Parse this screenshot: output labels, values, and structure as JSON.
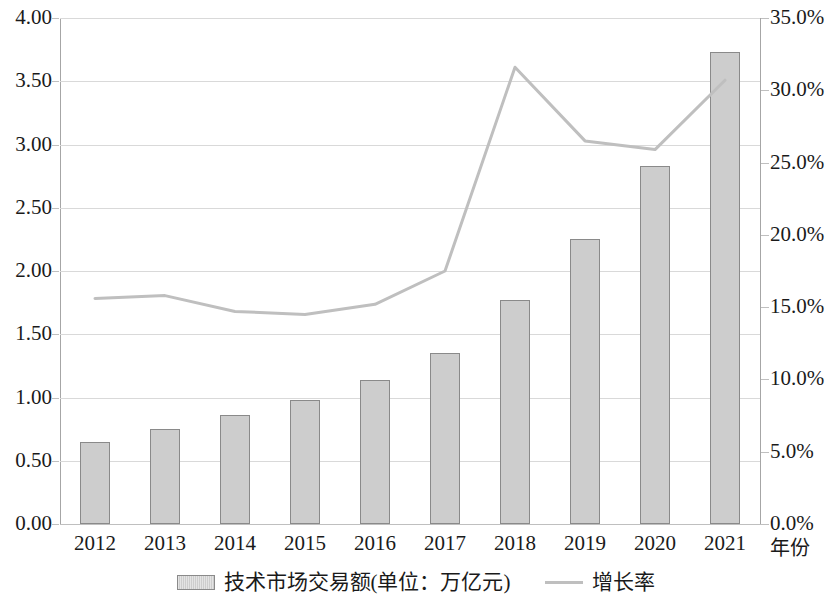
{
  "chart_data": {
    "type": "bar",
    "title": "",
    "subtitle": "",
    "categories": [
      "2012",
      "2013",
      "2014",
      "2015",
      "2016",
      "2017",
      "2018",
      "2019",
      "2020",
      "2021"
    ],
    "xlabel": "年份",
    "grid": true,
    "legend_position": "bottom",
    "series": [
      {
        "name": "技术市场交易额(单位：万亿元)",
        "type": "bar",
        "axis": "left",
        "color": "#cdcdcd",
        "border_color": "#8a8a8a",
        "values": [
          0.65,
          0.75,
          0.86,
          0.98,
          1.14,
          1.35,
          1.77,
          2.25,
          2.83,
          3.73
        ]
      },
      {
        "name": "增长率",
        "type": "line",
        "axis": "right",
        "color": "#bfbfbf",
        "values": [
          15.6,
          15.8,
          14.7,
          14.5,
          15.2,
          17.5,
          31.6,
          26.5,
          25.9,
          30.7
        ]
      }
    ],
    "left_axis": {
      "label": "",
      "ylim": [
        0.0,
        4.0
      ],
      "ticks": [
        "0.00",
        "0.50",
        "1.00",
        "1.50",
        "2.00",
        "2.50",
        "3.00",
        "3.50",
        "4.00"
      ],
      "tick_values": [
        0.0,
        0.5,
        1.0,
        1.5,
        2.0,
        2.5,
        3.0,
        3.5,
        4.0
      ]
    },
    "right_axis": {
      "label": "",
      "ylim": [
        0.0,
        35.0
      ],
      "ticks": [
        "0.0%",
        "5.0%",
        "10.0%",
        "15.0%",
        "20.0%",
        "25.0%",
        "30.0%",
        "35.0%"
      ],
      "tick_values": [
        0.0,
        5.0,
        10.0,
        15.0,
        20.0,
        25.0,
        30.0,
        35.0
      ]
    }
  },
  "legend": {
    "items": [
      {
        "label": "技术市场交易额(单位：万亿元)",
        "marker": "bar-swatch"
      },
      {
        "label": "增长率",
        "marker": "line-swatch"
      }
    ]
  }
}
